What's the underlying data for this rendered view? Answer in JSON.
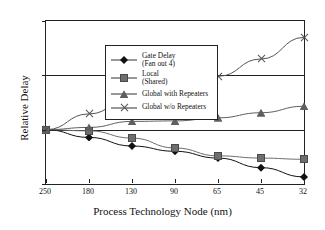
{
  "chart_data": {
    "type": "line",
    "title": "",
    "xlabel": "Process Technology Node (nm)",
    "ylabel": "Relative Delay",
    "categories": [
      "250",
      "180",
      "130",
      "90",
      "65",
      "45",
      "32"
    ],
    "xtick_labels": [
      "250",
      "180",
      "130",
      "90",
      "65",
      "45",
      "32"
    ],
    "ytick_labels": [
      "0.1",
      "1",
      "10",
      "100"
    ],
    "ytick_values": [
      0.1,
      1,
      10,
      100
    ],
    "yscale": "log",
    "ylim": [
      0.1,
      100
    ],
    "grid": "horizontal-at-1-and-10",
    "legend_position": "upper-left-inside",
    "series": [
      {
        "name": "Gate Delay\n(Fan out 4)",
        "label_line1": "Gate Delay",
        "label_line2": "(Fan out 4)",
        "marker": "diamond",
        "color": "#111111",
        "values": [
          1.0,
          0.72,
          0.5,
          0.4,
          0.3,
          0.2,
          0.135
        ]
      },
      {
        "name": "Local\n(Shared)",
        "label_line1": "Local",
        "label_line2": "(Shared)",
        "marker": "square",
        "color": "#6e6e6e",
        "values": [
          1.0,
          0.95,
          0.7,
          0.46,
          0.33,
          0.3,
          0.285
        ]
      },
      {
        "name": "Global with Repeaters",
        "label_line1": "Global with Repeaters",
        "label_line2": "",
        "marker": "triangle",
        "color": "#5f5f5f",
        "values": [
          1.0,
          1.1,
          1.42,
          1.45,
          1.65,
          2.05,
          2.7
        ]
      },
      {
        "name": "Global w/o Repeaters",
        "label_line1": "Global w/o Repeaters",
        "label_line2": "",
        "marker": "cross",
        "color": "#555555",
        "values": [
          1.0,
          1.95,
          3.9,
          5.4,
          9.6,
          20.0,
          50.0
        ]
      }
    ]
  },
  "axes": {
    "y_label": "Relative Delay",
    "x_label": "Process Technology Node (nm)",
    "y_ticks": [
      "100",
      "10",
      "1",
      "0.1"
    ],
    "x_ticks": [
      "250",
      "180",
      "130",
      "90",
      "65",
      "45",
      "32"
    ]
  },
  "legend": {
    "items": [
      {
        "line1": "Gate Delay",
        "line2": "(Fan out 4)",
        "marker": "diamond-icon"
      },
      {
        "line1": "Local",
        "line2": "(Shared)",
        "marker": "square-icon"
      },
      {
        "line1": "Global with Repeaters",
        "line2": "",
        "marker": "triangle-icon"
      },
      {
        "line1": "Global w/o Repeaters",
        "line2": "",
        "marker": "cross-icon"
      }
    ]
  },
  "colors": {
    "axis": "#222222",
    "gate_delay": "#111111",
    "local": "#6e6e6e",
    "global_repeaters": "#5f5f5f",
    "global_no_repeaters": "#555555",
    "background": "#ffffff"
  }
}
